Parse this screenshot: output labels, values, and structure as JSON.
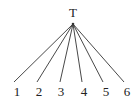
{
  "diagram": {
    "root": {
      "label": "T",
      "x": 73,
      "y": 13,
      "apex_x": 73,
      "apex_y": 24
    },
    "children": [
      {
        "label": "1",
        "line_x": 14,
        "label_x": 17
      },
      {
        "label": "2",
        "line_x": 37,
        "label_x": 39
      },
      {
        "label": "3",
        "line_x": 60,
        "label_x": 61
      },
      {
        "label": "4",
        "line_x": 82,
        "label_x": 84
      },
      {
        "label": "5",
        "line_x": 103,
        "label_x": 106
      },
      {
        "label": "6",
        "line_x": 124,
        "label_x": 127
      }
    ],
    "line_end_y": 82,
    "label_y": 96,
    "stroke_color": "#333333",
    "text_color": "#222222"
  }
}
